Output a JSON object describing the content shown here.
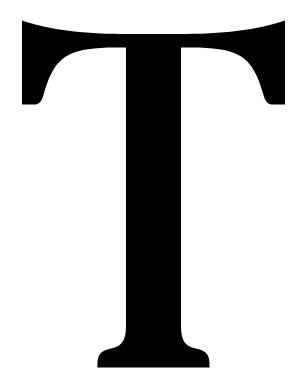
{
  "image": {
    "kind": "glyph-image",
    "subject": "letter-t",
    "character": "T",
    "letter_case": "uppercase",
    "script": "Latin",
    "typeface_style": "serif",
    "description": "Black serif capital letter T centered on a plain white background",
    "width_px": 307,
    "height_px": 387,
    "alt_text": "Capital letter T in a black serif typeface on a white background"
  },
  "colors": {
    "glyph": "#000000",
    "background": "#ffffff"
  },
  "geometry": {
    "crossbar": {
      "left_x": 22,
      "right_x": 285,
      "top_y": 20,
      "center_top_y": 26,
      "serif_bottom_y": 105,
      "bar_bottom_y": 60
    },
    "stem": {
      "left_x": 128,
      "right_x": 181,
      "width_px": 53,
      "top_y": 60,
      "flare_start_y": 330
    },
    "foot_serif": {
      "left_x": 100,
      "right_x": 210,
      "baseline_y": 368,
      "width_px": 110
    }
  },
  "glyph_path": "M 22.0 20.5 C 60.0 33.0 100.0 34.0 133.0 34.0 L 174.0 34.0 C 207.0 34.0 247.0 33.0 285.0 20.5 L 285.0 104.5 L 273.0 104.5 C 268.0 104.5 265.5 102.0 263.5 95.0 C 257.0 72.0 250.0 60.5 237.5 54.5 C 227.0 49.5 213.0 47.5 192.0 47.5 L 181.0 47.5 L 181.0 325.0 C 181.0 340.0 184.5 346.0 196.0 348.5 C 204.0 350.2 207.5 353.0 208.8 358.0 C 209.4 360.4 209.6 363.5 209.6 367.6 L 97.4 367.6 C 97.4 363.5 97.6 360.4 98.2 358.0 C 99.5 353.0 103.0 350.2 111.0 348.5 C 122.5 346.0 126.0 340.0 126.0 325.0 L 126.0 47.5 L 115.0 47.5 C 94.0 47.5 80.0 49.5 69.5 54.5 C 57.0 60.5 50.0 72.0 43.5 95.0 C 41.5 102.0 39.0 104.5 34.0 104.5 L 22.0 104.5 Z"
}
